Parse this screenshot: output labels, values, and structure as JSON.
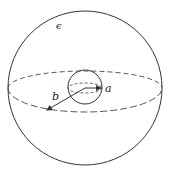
{
  "diagram": {
    "colors": {
      "stroke": "#333333",
      "background": "#ffffff"
    },
    "outer_sphere": {
      "cx": 85,
      "cy": 88,
      "r": 77,
      "equator_ry": 17
    },
    "inner_sphere": {
      "cx": 85,
      "cy": 87,
      "r": 17,
      "equator_ry": 5
    },
    "labels": {
      "epsilon": "ϵ",
      "a": "a",
      "b": "b"
    }
  }
}
